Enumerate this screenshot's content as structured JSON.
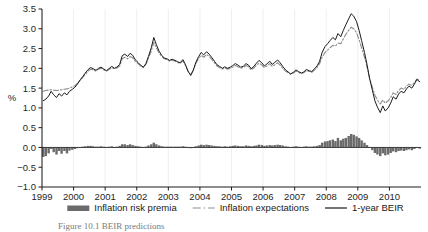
{
  "figure": {
    "caption": "Figure 10.1  BEIR predictions"
  },
  "legend": {
    "position": "bottom",
    "items": [
      {
        "label": "Inflation risk premia",
        "marker": "filled-bar",
        "color": "#6b6b6b"
      },
      {
        "label": "Inflation expectations",
        "marker": "dash-dot-line",
        "color": "#8c8c8c"
      },
      {
        "label": "1-year BEIR",
        "marker": "solid-line",
        "color": "#1a1a1a"
      }
    ]
  },
  "chart_data": {
    "type": "line",
    "title": "",
    "xlabel": "",
    "ylabel": "%",
    "ylim": [
      -1.0,
      3.5
    ],
    "yticks": [
      -1.0,
      -0.5,
      0.0,
      0.5,
      1.0,
      1.5,
      2.0,
      2.5,
      3.0,
      3.5
    ],
    "ytick_labels": [
      "-1.0",
      "-0.5",
      "0.0",
      "0.5",
      "1.0",
      "1.5",
      "2.0",
      "2.5",
      "3.0",
      "3.5"
    ],
    "xlim": [
      1999.0,
      2011.0
    ],
    "xticks": [
      1999,
      2000,
      2001,
      2002,
      2003,
      2004,
      2005,
      2006,
      2007,
      2008,
      2009,
      2010
    ],
    "xtick_labels": [
      "1999",
      "2000",
      "2001",
      "2002",
      "2003",
      "2004",
      "2005",
      "2006",
      "2007",
      "2008",
      "2009",
      "2010"
    ],
    "grid": "vertical-faint",
    "legend_position": "bottom",
    "x": [
      1999.04,
      1999.12,
      1999.21,
      1999.29,
      1999.37,
      1999.46,
      1999.54,
      1999.62,
      1999.71,
      1999.79,
      1999.87,
      1999.96,
      2000.04,
      2000.12,
      2000.21,
      2000.29,
      2000.37,
      2000.46,
      2000.54,
      2000.62,
      2000.71,
      2000.79,
      2000.87,
      2000.96,
      2001.04,
      2001.12,
      2001.21,
      2001.29,
      2001.37,
      2001.46,
      2001.54,
      2001.62,
      2001.71,
      2001.79,
      2001.87,
      2001.96,
      2002.04,
      2002.12,
      2002.21,
      2002.29,
      2002.37,
      2002.46,
      2002.54,
      2002.62,
      2002.71,
      2002.79,
      2002.87,
      2002.96,
      2003.04,
      2003.12,
      2003.21,
      2003.29,
      2003.37,
      2003.46,
      2003.54,
      2003.62,
      2003.71,
      2003.79,
      2003.87,
      2003.96,
      2004.04,
      2004.12,
      2004.21,
      2004.29,
      2004.37,
      2004.46,
      2004.54,
      2004.62,
      2004.71,
      2004.79,
      2004.87,
      2004.96,
      2005.04,
      2005.12,
      2005.21,
      2005.29,
      2005.37,
      2005.46,
      2005.54,
      2005.62,
      2005.71,
      2005.79,
      2005.87,
      2005.96,
      2006.04,
      2006.12,
      2006.21,
      2006.29,
      2006.37,
      2006.46,
      2006.54,
      2006.62,
      2006.71,
      2006.79,
      2006.87,
      2006.96,
      2007.04,
      2007.12,
      2007.21,
      2007.29,
      2007.37,
      2007.46,
      2007.54,
      2007.62,
      2007.71,
      2007.79,
      2007.87,
      2007.96,
      2008.04,
      2008.12,
      2008.21,
      2008.29,
      2008.37,
      2008.46,
      2008.54,
      2008.62,
      2008.71,
      2008.79,
      2008.87,
      2008.96,
      2009.04,
      2009.12,
      2009.21,
      2009.29,
      2009.37,
      2009.46,
      2009.54,
      2009.62,
      2009.71,
      2009.79,
      2009.87,
      2009.96,
      2010.04,
      2010.12,
      2010.21,
      2010.29,
      2010.37,
      2010.46,
      2010.54,
      2010.62,
      2010.71,
      2010.79,
      2010.87,
      2010.96
    ],
    "series": [
      {
        "name": "1-year BEIR",
        "style": "solid",
        "color": "#1a1a1a",
        "values": [
          1.18,
          1.22,
          1.3,
          1.42,
          1.33,
          1.26,
          1.36,
          1.3,
          1.38,
          1.33,
          1.42,
          1.47,
          1.52,
          1.6,
          1.71,
          1.79,
          1.88,
          1.97,
          2.02,
          1.99,
          1.95,
          2.0,
          2.03,
          1.98,
          1.94,
          1.99,
          2.05,
          2.0,
          2.03,
          2.1,
          2.32,
          2.36,
          2.3,
          2.38,
          2.33,
          2.21,
          2.15,
          2.08,
          2.03,
          2.12,
          2.3,
          2.52,
          2.78,
          2.6,
          2.43,
          2.33,
          2.26,
          2.24,
          2.2,
          2.23,
          2.2,
          2.17,
          2.14,
          2.22,
          2.1,
          1.93,
          1.82,
          1.95,
          2.15,
          2.3,
          2.4,
          2.34,
          2.42,
          2.36,
          2.28,
          2.18,
          2.09,
          2.05,
          2.0,
          2.04,
          2.0,
          2.03,
          2.07,
          2.12,
          2.08,
          2.03,
          2.05,
          2.12,
          2.08,
          1.99,
          2.05,
          2.13,
          2.2,
          2.14,
          2.06,
          2.11,
          2.18,
          2.1,
          2.15,
          2.21,
          2.14,
          2.05,
          1.96,
          1.91,
          1.86,
          1.9,
          1.96,
          1.92,
          1.88,
          1.91,
          1.97,
          1.94,
          1.92,
          1.98,
          2.06,
          2.18,
          2.4,
          2.55,
          2.62,
          2.7,
          2.78,
          2.72,
          2.88,
          2.8,
          2.96,
          3.1,
          3.25,
          3.38,
          3.32,
          3.18,
          2.96,
          2.7,
          2.4,
          2.1,
          1.75,
          1.45,
          1.18,
          1.02,
          0.88,
          1.05,
          0.92,
          1.0,
          1.12,
          1.28,
          1.22,
          1.35,
          1.42,
          1.38,
          1.48,
          1.55,
          1.5,
          1.6,
          1.72,
          1.66
        ]
      },
      {
        "name": "Inflation expectations",
        "style": "dash-dot",
        "color": "#8c8c8c",
        "values": [
          1.42,
          1.44,
          1.45,
          1.46,
          1.45,
          1.44,
          1.45,
          1.46,
          1.47,
          1.48,
          1.5,
          1.53,
          1.56,
          1.62,
          1.7,
          1.77,
          1.85,
          1.93,
          1.98,
          1.96,
          1.93,
          1.98,
          2.0,
          1.96,
          1.93,
          1.97,
          2.02,
          1.99,
          2.01,
          2.06,
          2.24,
          2.28,
          2.24,
          2.3,
          2.27,
          2.17,
          2.12,
          2.06,
          2.02,
          2.1,
          2.25,
          2.44,
          2.66,
          2.52,
          2.38,
          2.3,
          2.24,
          2.22,
          2.18,
          2.21,
          2.18,
          2.15,
          2.12,
          2.19,
          2.08,
          1.94,
          1.84,
          1.96,
          2.12,
          2.25,
          2.33,
          2.28,
          2.35,
          2.3,
          2.23,
          2.14,
          2.06,
          2.02,
          1.98,
          2.01,
          1.98,
          2.0,
          2.03,
          2.07,
          2.04,
          2.0,
          2.02,
          2.07,
          2.04,
          1.96,
          2.01,
          2.08,
          2.13,
          2.08,
          2.02,
          2.06,
          2.12,
          2.05,
          2.09,
          2.14,
          2.08,
          2.0,
          1.93,
          1.89,
          1.85,
          1.88,
          1.93,
          1.9,
          1.87,
          1.89,
          1.94,
          1.92,
          1.9,
          1.95,
          2.02,
          2.12,
          2.28,
          2.4,
          2.46,
          2.52,
          2.58,
          2.56,
          2.64,
          2.62,
          2.74,
          2.86,
          2.96,
          3.04,
          3.0,
          2.9,
          2.72,
          2.52,
          2.28,
          2.04,
          1.76,
          1.52,
          1.32,
          1.2,
          1.1,
          1.2,
          1.12,
          1.18,
          1.26,
          1.38,
          1.34,
          1.44,
          1.5,
          1.47,
          1.55,
          1.6,
          1.57,
          1.64,
          1.73,
          1.69
        ]
      }
    ],
    "bars": {
      "name": "Inflation risk premia",
      "color": "#6b6b6b",
      "values": [
        -0.24,
        -0.22,
        -0.15,
        -0.04,
        -0.12,
        -0.18,
        -0.09,
        -0.16,
        -0.09,
        -0.15,
        -0.08,
        -0.06,
        -0.04,
        -0.02,
        0.01,
        0.02,
        0.03,
        0.04,
        0.04,
        0.03,
        0.02,
        0.02,
        0.03,
        0.02,
        0.01,
        0.02,
        0.03,
        0.01,
        0.02,
        0.04,
        0.08,
        0.08,
        0.06,
        0.08,
        0.06,
        0.04,
        0.03,
        0.02,
        0.01,
        0.02,
        0.05,
        0.08,
        0.12,
        0.08,
        0.05,
        0.03,
        0.02,
        0.02,
        0.02,
        0.02,
        0.02,
        0.02,
        0.02,
        0.03,
        0.02,
        -0.01,
        -0.02,
        -0.01,
        0.03,
        0.05,
        0.07,
        0.06,
        0.07,
        0.06,
        0.05,
        0.04,
        0.03,
        0.03,
        0.02,
        0.03,
        0.02,
        0.03,
        0.04,
        0.05,
        0.04,
        0.03,
        0.03,
        0.05,
        0.04,
        0.03,
        0.04,
        0.05,
        0.07,
        0.06,
        0.04,
        0.05,
        0.06,
        0.05,
        0.06,
        0.07,
        0.06,
        0.05,
        0.03,
        0.02,
        0.01,
        0.02,
        0.03,
        0.02,
        0.01,
        0.02,
        0.03,
        0.02,
        0.02,
        0.03,
        0.04,
        0.06,
        0.12,
        0.15,
        0.16,
        0.18,
        0.2,
        0.16,
        0.24,
        0.18,
        0.22,
        0.24,
        0.29,
        0.34,
        0.32,
        0.28,
        0.24,
        0.18,
        0.12,
        0.06,
        -0.01,
        -0.07,
        -0.14,
        -0.18,
        -0.22,
        -0.15,
        -0.2,
        -0.18,
        -0.14,
        -0.1,
        -0.12,
        -0.09,
        -0.08,
        -0.09,
        -0.07,
        -0.05,
        -0.07,
        -0.04,
        -0.01,
        -0.03
      ]
    }
  }
}
